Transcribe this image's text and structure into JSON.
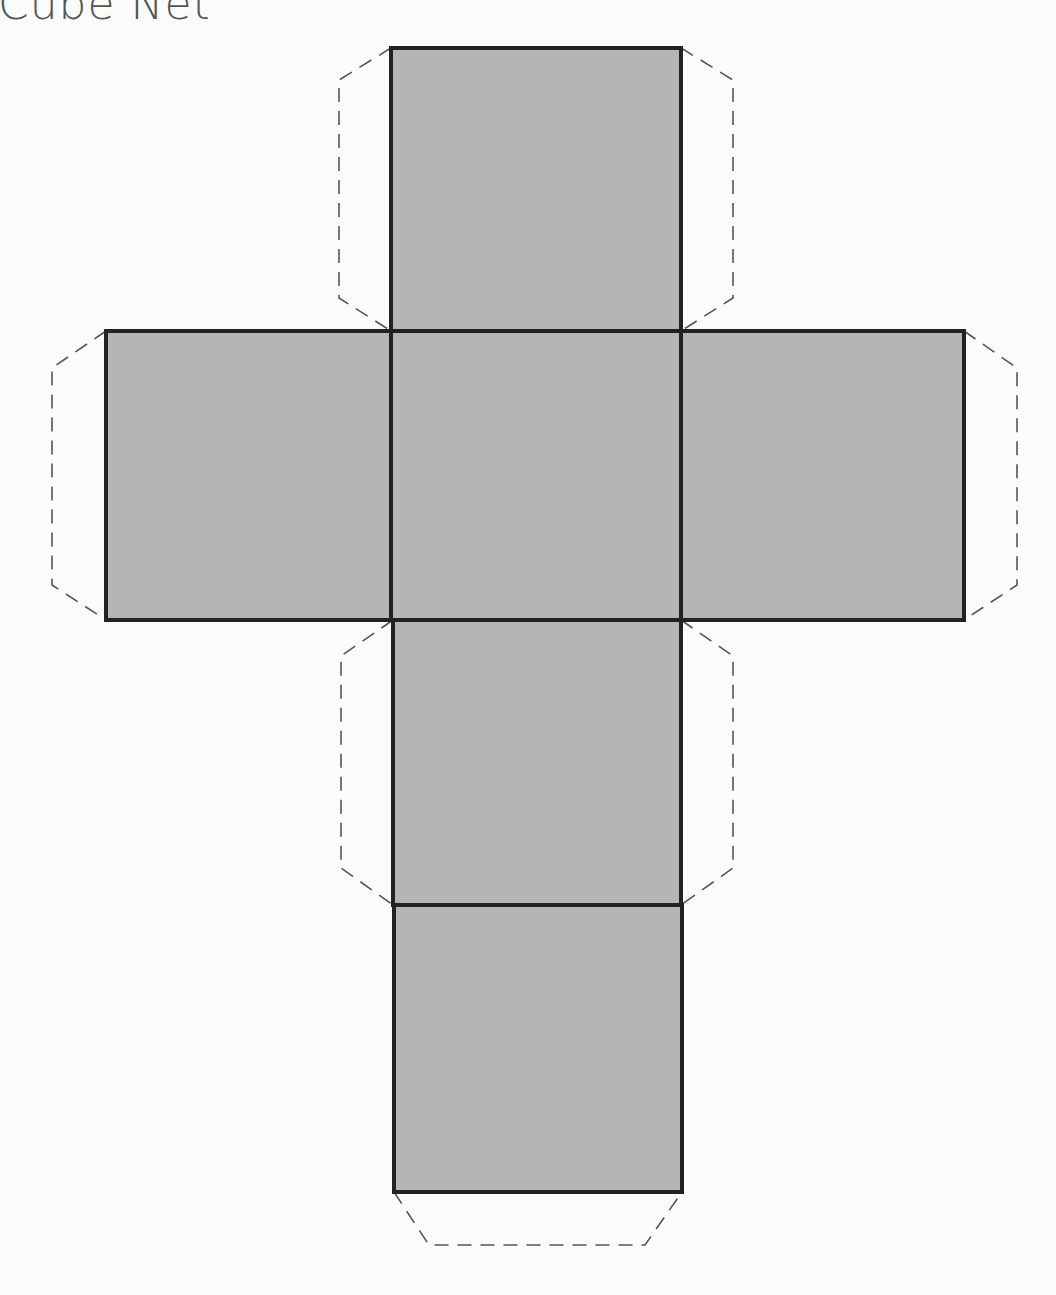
{
  "title": "Cube Net",
  "colors": {
    "face_fill": "#b5b5b5",
    "face_stroke": "#222222",
    "tab_stroke": "#555555",
    "background": "#fbfbfb"
  },
  "faces": [
    {
      "name": "top",
      "x": 391,
      "y": 48,
      "w": 290,
      "h": 283
    },
    {
      "name": "left",
      "x": 106,
      "y": 331,
      "w": 285,
      "h": 289
    },
    {
      "name": "center",
      "x": 391,
      "y": 331,
      "w": 290,
      "h": 289
    },
    {
      "name": "right",
      "x": 681,
      "y": 331,
      "w": 283,
      "h": 289
    },
    {
      "name": "lower",
      "x": 393,
      "y": 620,
      "w": 288,
      "h": 285
    },
    {
      "name": "bottom",
      "x": 394,
      "y": 905,
      "w": 288,
      "h": 287
    }
  ],
  "tabs": [
    {
      "name": "top-left-tab",
      "points": "391,48 339,80 339,298 391,331"
    },
    {
      "name": "top-right-tab",
      "points": "681,48 733,80 733,298 681,331"
    },
    {
      "name": "left-tab",
      "points": "106,331 52,368 52,585 106,620"
    },
    {
      "name": "right-tab",
      "points": "964,331 1017,368 1017,585 964,620"
    },
    {
      "name": "lower-left-tab",
      "points": "393,620 341,656 341,868 393,905"
    },
    {
      "name": "lower-right-tab",
      "points": "681,620 733,656 733,868 681,905"
    },
    {
      "name": "bottom-tab",
      "points": "394,1192 429,1245 645,1245 682,1192"
    }
  ]
}
